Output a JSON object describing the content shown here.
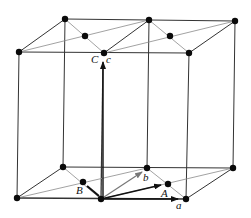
{
  "diagram": {
    "labels": {
      "a": "a",
      "b": "b",
      "c": "c",
      "A": "A",
      "B": "B",
      "C": "C"
    },
    "colors": {
      "line": "#222222",
      "thin_line": "#9a9a9a",
      "atom": "#0a0a0a",
      "background": "#ffffff"
    }
  }
}
